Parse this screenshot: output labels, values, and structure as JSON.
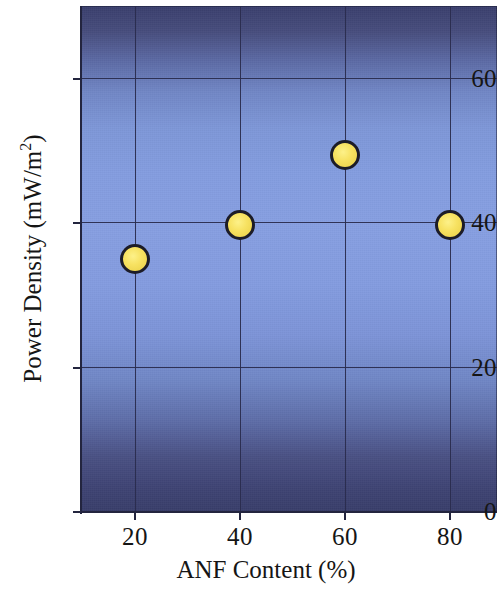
{
  "chart_data": {
    "type": "scatter",
    "title": "",
    "xlabel": "ANF Content (%)",
    "ylabel": "Power Density (mW/m",
    "ylabel_superscript": "2",
    "ylabel_suffix": ")",
    "ylabel_full": "Power Density (mW/m2)",
    "x": [
      20,
      40,
      60,
      80
    ],
    "values": [
      35.0,
      39.7,
      49.4,
      39.7
    ],
    "series": [
      {
        "name": "Power Density",
        "x": [
          20,
          40,
          60,
          80
        ],
        "values": [
          35.0,
          39.7,
          49.4,
          39.7
        ]
      }
    ],
    "xlim": [
      10,
      90
    ],
    "ylim": [
      0,
      70
    ],
    "xticks": [
      20,
      40,
      60,
      80
    ],
    "yticks": [
      0,
      20,
      40,
      60
    ],
    "xtick_labels": [
      "20",
      "40",
      "60",
      "80"
    ],
    "ytick_labels": [
      "0",
      "20",
      "40",
      "60"
    ],
    "grid": true,
    "legend": null,
    "marker_color": "#f2dd5a",
    "marker_edge_color": "#1c1c28",
    "plot_background_top_color": "#3a3f6d",
    "plot_background_mid_color": "#879fe2",
    "plot_background_bottom_color": "#393e6a",
    "axis_color": "#23253f",
    "text_color": "#151515"
  },
  "axes": {
    "y_tick_labels": [
      "60",
      "40",
      "20",
      "0"
    ],
    "x_tick_labels": [
      "20",
      "40",
      "60",
      "80"
    ],
    "y_title_main": "Power Density (mW/m",
    "y_title_sup": "2",
    "y_title_end": ")",
    "x_title": "ANF Content (%)"
  }
}
